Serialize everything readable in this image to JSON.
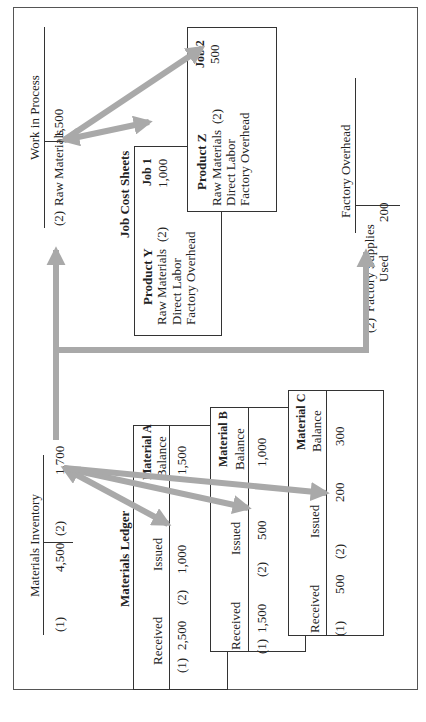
{
  "materials_inventory": {
    "title": "Materials Inventory",
    "debit_ref": "(1)",
    "debit_amount": "4,500",
    "credit_ref": "(2)",
    "credit_amount": "1,700"
  },
  "work_in_process": {
    "title": "Work in Process",
    "debit_ref": "(2)",
    "debit_label": "Raw Materials",
    "debit_amount": "1,500"
  },
  "factory_overhead": {
    "title": "Factory Overhead",
    "debit_ref": "(2)",
    "debit_label_line1": "Factory Supplies",
    "debit_label_line2": "Used",
    "debit_amount": "200"
  },
  "job_cost_sheets": {
    "title": "Job Cost Sheets",
    "jobs": [
      {
        "job": "Job 1",
        "amount": "1,000",
        "product": "Product Y",
        "lines": [
          "Raw Materials",
          "Direct Labor",
          "Factory Overhead"
        ],
        "ref": "(2)"
      },
      {
        "job": "Job 2",
        "amount": "500",
        "product": "Product Z",
        "lines": [
          "Raw Materials",
          "Direct Labor",
          "Factory Overhead"
        ],
        "ref": "(2)"
      }
    ]
  },
  "materials_ledger": {
    "title": "Materials Ledger",
    "columns": [
      "Received",
      "Issued",
      "Balance"
    ],
    "cards": [
      {
        "material": "Material A",
        "received_ref": "(1)",
        "received": "2,500",
        "issued_ref": "(2)",
        "issued": "1,000",
        "balance": "1,500"
      },
      {
        "material": "Material B",
        "received_ref": "(1)",
        "received": "1,500",
        "issued_ref": "(2)",
        "issued": "500",
        "balance": "1,000"
      },
      {
        "material": "Material C",
        "received_ref": "(1)",
        "received": "500",
        "issued_ref": "(2)",
        "issued": "200",
        "balance": "300"
      }
    ]
  },
  "colors": {
    "arrow": "#a9a9a9",
    "line": "#333333"
  }
}
